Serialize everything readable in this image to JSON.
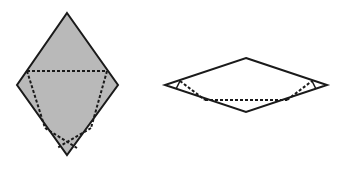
{
  "diagram": {
    "background": "#ffffff",
    "stroke_color": "#1a1a1a",
    "fill_color": "#b9b9b9",
    "figures": [
      {
        "name": "tall-rhombus-shaded",
        "filled": true,
        "outline": [
          [
            67,
            13
          ],
          [
            118,
            85
          ],
          [
            67,
            155
          ],
          [
            17,
            85
          ]
        ],
        "dashed_lines": [
          [
            [
              27,
              71
            ],
            [
              107,
              71
            ]
          ],
          [
            [
              27,
              71
            ],
            [
              45,
              128
            ]
          ],
          [
            [
              45,
              128
            ],
            [
              77,
              148
            ]
          ],
          [
            [
              107,
              71
            ],
            [
              91,
              128
            ]
          ],
          [
            [
              91,
              128
            ],
            [
              57,
              148
            ]
          ]
        ],
        "solid_lines": []
      },
      {
        "name": "flat-rhombus-outline",
        "filled": false,
        "outline": [
          [
            246,
            58
          ],
          [
            327,
            85
          ],
          [
            246,
            112
          ],
          [
            165,
            85
          ]
        ],
        "dashed_lines": [
          [
            [
              180,
              81
            ],
            [
              205,
              100
            ]
          ],
          [
            [
              205,
              100
            ],
            [
              287,
              100
            ]
          ],
          [
            [
              287,
              100
            ],
            [
              312,
              81
            ]
          ]
        ],
        "solid_lines": [
          [
            [
              180,
              81
            ],
            [
              176,
              89
            ]
          ],
          [
            [
              312,
              81
            ],
            [
              316,
              89
            ]
          ]
        ]
      }
    ]
  }
}
